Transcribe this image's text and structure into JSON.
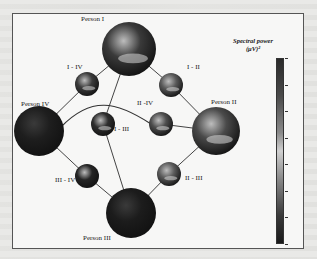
{
  "figure": {
    "colorbar": {
      "title": "Spectral power",
      "unit": "(μV)²",
      "gradient": [
        "#2a2a2a",
        "#d0d0d0",
        "#1a1a1a"
      ],
      "tick_count": 8
    },
    "nodes": [
      {
        "id": "person-i",
        "label": "Person I",
        "cx": 128,
        "cy": 48,
        "r": 27,
        "kind": "person",
        "tone": "#3a3a3a"
      },
      {
        "id": "i-iv",
        "label": "I - IV",
        "cx": 86,
        "cy": 83,
        "r": 12,
        "kind": "pair",
        "tone": "#3c3c3c"
      },
      {
        "id": "i-ii",
        "label": "I - II",
        "cx": 170,
        "cy": 84,
        "r": 12,
        "kind": "pair",
        "tone": "#5a5a5a"
      },
      {
        "id": "person-iv",
        "label": "Person IV",
        "cx": 38,
        "cy": 130,
        "r": 25,
        "kind": "person",
        "tone": "#1e1e1e"
      },
      {
        "id": "person-ii",
        "label": "Person II",
        "cx": 215,
        "cy": 130,
        "r": 24,
        "kind": "person",
        "tone": "#4a4a4a"
      },
      {
        "id": "i-iii",
        "label": "I - III",
        "cx": 102,
        "cy": 123,
        "r": 12,
        "kind": "pair",
        "tone": "#2e2e2e"
      },
      {
        "id": "ii-iv",
        "label": "II -IV",
        "cx": 160,
        "cy": 123,
        "r": 12,
        "kind": "pair",
        "tone": "#4e4e4e"
      },
      {
        "id": "iii-iv",
        "label": "III - IV",
        "cx": 86,
        "cy": 175,
        "r": 12,
        "kind": "pair",
        "tone": "#252525"
      },
      {
        "id": "ii-iii",
        "label": "II - III",
        "cx": 168,
        "cy": 173,
        "r": 12,
        "kind": "pair",
        "tone": "#5c5c5c"
      },
      {
        "id": "person-iii",
        "label": "Person III",
        "cx": 130,
        "cy": 212,
        "r": 25,
        "kind": "person",
        "tone": "#1c1c1c"
      }
    ],
    "labels": [
      {
        "text": "Person I",
        "x": 80,
        "y": 14
      },
      {
        "text": "I - IV",
        "x": 66,
        "y": 62
      },
      {
        "text": "I - II",
        "x": 186,
        "y": 62
      },
      {
        "text": "Person IV",
        "x": 20,
        "y": 99
      },
      {
        "text": "Person II",
        "x": 210,
        "y": 97
      },
      {
        "text": "II -IV",
        "x": 136,
        "y": 98
      },
      {
        "text": "I - III",
        "x": 113,
        "y": 124
      },
      {
        "text": "III - IV",
        "x": 54,
        "y": 175
      },
      {
        "text": "II - III",
        "x": 184,
        "y": 173
      },
      {
        "text": "Person III",
        "x": 82,
        "y": 233
      }
    ],
    "edges": [
      [
        "person-i",
        "i-iv"
      ],
      [
        "person-i",
        "i-ii"
      ],
      [
        "person-i",
        "i-iii"
      ],
      [
        "i-iv",
        "person-iv"
      ],
      [
        "i-ii",
        "person-ii"
      ],
      [
        "person-iv",
        "iii-iv"
      ],
      [
        "iii-iv",
        "person-iii"
      ],
      [
        "person-ii",
        "ii-iii"
      ],
      [
        "ii-iii",
        "person-iii"
      ],
      [
        "i-iii",
        "person-iii"
      ],
      [
        "ii-iv",
        "person-ii"
      ]
    ],
    "curve_edge": {
      "from": "person-iv",
      "via": "ii-iv",
      "label": "Person IV to II-IV arc"
    }
  }
}
